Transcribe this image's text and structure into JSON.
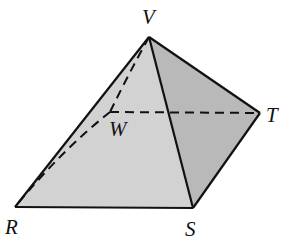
{
  "diagram": {
    "type": "geometric-solid",
    "colors": {
      "front_face": "#d2d2d2",
      "right_face": "#b9b9b9",
      "edge": "#111111",
      "background": "#ffffff"
    },
    "vertices": {
      "V": {
        "label": "V",
        "x": 149,
        "y": 37,
        "label_x": 142,
        "label_y": 24
      },
      "R": {
        "label": "R",
        "x": 15,
        "y": 207,
        "label_x": 5,
        "label_y": 234
      },
      "S": {
        "label": "S",
        "x": 193,
        "y": 208,
        "label_x": 185,
        "label_y": 236
      },
      "T": {
        "label": "T",
        "x": 260,
        "y": 113,
        "label_x": 266,
        "label_y": 122
      },
      "W": {
        "label": "W",
        "x": 110,
        "y": 112,
        "label_x": 109,
        "label_y": 136
      }
    },
    "visible_edges": [
      "VR",
      "VS",
      "VT",
      "RS",
      "ST"
    ],
    "hidden_edges": [
      "VW",
      "WR",
      "WT"
    ]
  }
}
